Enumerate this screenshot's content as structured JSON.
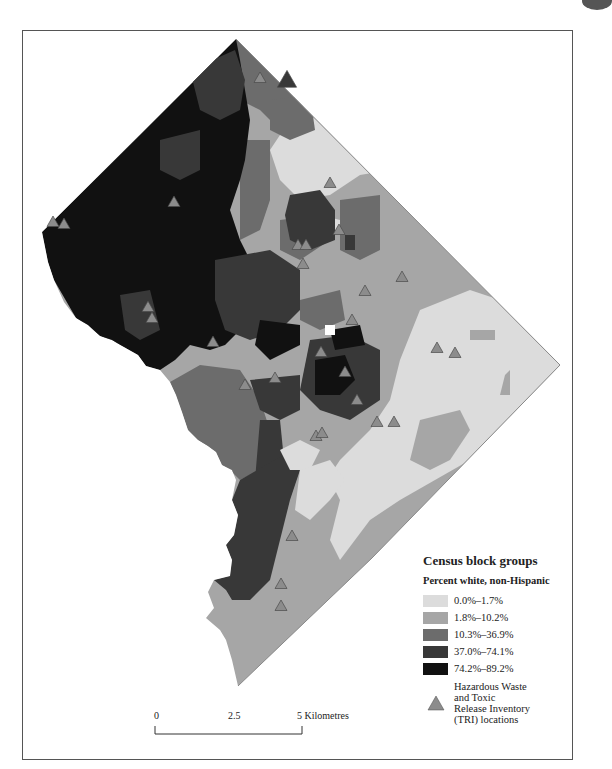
{
  "map": {
    "title": "Distribution of Percent white, non-Hispanic by census block group with TRI locations",
    "colors": {
      "class0": "#dcdcdc",
      "class1": "#a6a6a6",
      "class2": "#6c6c6c",
      "class3": "#383838",
      "class4": "#111111",
      "tri_fill": "#8c8c8c",
      "tri_stroke": "#4a4a4a",
      "frame": "#555555"
    }
  },
  "legend": {
    "title": "Census block groups",
    "subtitle": "Percent  white, non-Hispanic",
    "classes": [
      {
        "label": "0.0%–1.7%",
        "color": "#dcdcdc"
      },
      {
        "label": "1.8%–10.2%",
        "color": "#a6a6a6"
      },
      {
        "label": "10.3%–36.9%",
        "color": "#6c6c6c"
      },
      {
        "label": "37.0%–74.1%",
        "color": "#383838"
      },
      {
        "label": "74.2%–89.2%",
        "color": "#111111"
      }
    ],
    "tri_label_lines": [
      "Hazardous Waste",
      "and Toxic",
      "Release Inventory",
      "(TRI) locations"
    ],
    "tri_icon": "triangle-icon"
  },
  "scale_bar": {
    "ticks": [
      "0",
      "2.5",
      "5 Kilometres"
    ]
  },
  "tri_sites_count": 30
}
